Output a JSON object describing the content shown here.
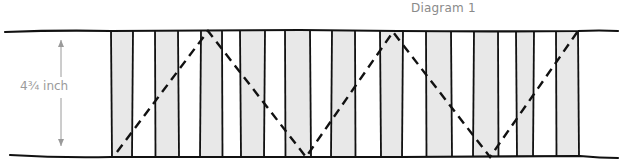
{
  "title": "Diagram 1",
  "dimension": {
    "label": "4¾ inch",
    "x": 61,
    "y_top": 40,
    "y_bottom": 146
  },
  "colors": {
    "stroke": "#111111",
    "stripe_fill": "#e8e8e8",
    "annotation": "#9a9a9a"
  },
  "band": {
    "top_y": 31,
    "bottom_y": 157,
    "left_x": 5,
    "right_x": 618
  },
  "stripe_lines": [
    111,
    133,
    155,
    178,
    201,
    222,
    240,
    265,
    285,
    310,
    332,
    355,
    380,
    403,
    426,
    451,
    474,
    498,
    516,
    534,
    556,
    578
  ],
  "shaded_stripes": [
    [
      111,
      133
    ],
    [
      155,
      178
    ],
    [
      201,
      222
    ],
    [
      240,
      265
    ],
    [
      285,
      310
    ],
    [
      332,
      355
    ],
    [
      380,
      403
    ],
    [
      426,
      451
    ],
    [
      474,
      498
    ],
    [
      516,
      534
    ],
    [
      556,
      578
    ]
  ],
  "zigzag_points": [
    [
      117,
      152
    ],
    [
      208,
      31
    ],
    [
      306,
      157
    ],
    [
      393,
      32
    ],
    [
      490,
      157
    ],
    [
      578,
      31
    ]
  ]
}
